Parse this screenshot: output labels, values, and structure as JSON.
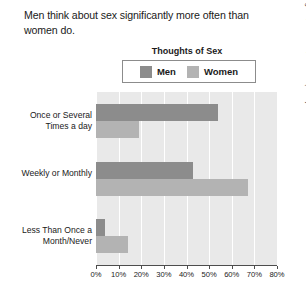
{
  "caption": "Men think about sex significantly more often than women do.",
  "legend": {
    "title": "Thoughts of Sex",
    "entries": [
      {
        "label": "Men",
        "color": "#8c8c8c"
      },
      {
        "label": "Women",
        "color": "#b3b3b3"
      }
    ]
  },
  "source_credit": "Adapted from Michael, Gagnon, Laumann, & Kolata (1994)",
  "chart_data": {
    "type": "bar",
    "orientation": "horizontal",
    "title": "Thoughts of Sex",
    "xlabel": "",
    "ylabel": "",
    "categories": [
      "Once or Several Times a day",
      "Weekly or Monthly",
      "Less Than Once a Month/Never"
    ],
    "series": [
      {
        "name": "Men",
        "color": "#8c8c8c",
        "values": [
          54,
          43,
          4
        ]
      },
      {
        "name": "Women",
        "color": "#b3b3b3",
        "values": [
          19,
          67,
          14
        ]
      }
    ],
    "xlim": [
      0,
      80
    ],
    "xticks": [
      0,
      10,
      20,
      30,
      40,
      50,
      60,
      70,
      80
    ],
    "xtick_labels": [
      "0%",
      "10%",
      "20%",
      "30%",
      "40%",
      "50%",
      "60%",
      "70%",
      "80%"
    ],
    "grid": true,
    "grid_axis": "x",
    "legend_position": "top",
    "plot_background": "#e9e9e9",
    "gridline_color": "#ffffff"
  }
}
